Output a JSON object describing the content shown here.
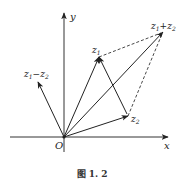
{
  "figure": {
    "caption": "图 1. 2",
    "axes": {
      "x_label": "x",
      "y_label": "y",
      "origin_label": "O"
    },
    "vectors": [
      {
        "name": "z1",
        "label_main": "z",
        "label_sub": "1",
        "from": [
          64,
          137
        ],
        "to": [
          99,
          57
        ],
        "style": "solid"
      },
      {
        "name": "z2",
        "label_main": "z",
        "label_sub": "2",
        "from": [
          64,
          137
        ],
        "to": [
          128,
          116
        ],
        "style": "solid"
      },
      {
        "name": "z1+z2",
        "from": [
          64,
          137
        ],
        "to": [
          163,
          32
        ],
        "style": "solid"
      },
      {
        "name": "z1-z2",
        "from": [
          64,
          137
        ],
        "to": [
          38,
          82
        ],
        "style": "solid"
      },
      {
        "name": "z2-to-z1",
        "from": [
          128,
          116
        ],
        "to": [
          99,
          57
        ],
        "style": "solid"
      }
    ],
    "dashed_edges": [
      {
        "name": "z1-to-sum",
        "from": [
          99,
          57
        ],
        "to": [
          163,
          32
        ]
      },
      {
        "name": "z2-to-sum",
        "from": [
          128,
          116
        ],
        "to": [
          163,
          32
        ]
      }
    ],
    "labels": {
      "z1": {
        "main": "z",
        "sub": "1"
      },
      "z2": {
        "main": "z",
        "sub": "2"
      },
      "sum": {
        "a": "z",
        "a_sub": "1",
        "op": "+",
        "b": "z",
        "b_sub": "2"
      },
      "diff": {
        "a": "z",
        "a_sub": "1",
        "op": "−",
        "b": "z",
        "b_sub": "2"
      }
    },
    "colors": {
      "line": "#222222",
      "text": "#222222"
    }
  }
}
